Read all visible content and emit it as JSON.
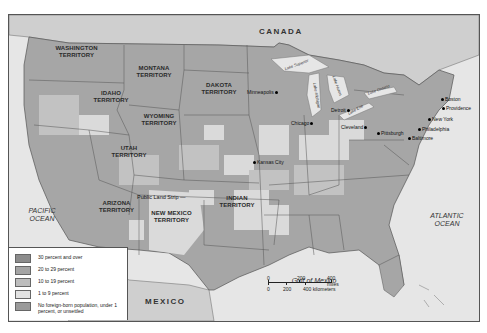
{
  "map": {
    "countries": {
      "canada": "CANADA",
      "mexico": "MEXICO"
    },
    "water_bodies": {
      "pacific": "PACIFIC OCEAN",
      "atlantic": "ATLANTIC OCEAN",
      "gulf": "Gulf of Mexico"
    },
    "lakes": [
      "Lake Superior",
      "Lake Michigan",
      "Lake Huron",
      "Lake Erie",
      "Lake Ontario"
    ],
    "territories": [
      {
        "name": "WASHINGTON TERRITORY"
      },
      {
        "name": "MONTANA TERRITORY"
      },
      {
        "name": "IDAHO TERRITORY"
      },
      {
        "name": "DAKOTA TERRITORY"
      },
      {
        "name": "WYOMING TERRITORY"
      },
      {
        "name": "UTAH TERRITORY"
      },
      {
        "name": "ARIZONA TERRITORY"
      },
      {
        "name": "NEW MEXICO TERRITORY"
      },
      {
        "name": "INDIAN TERRITORY"
      }
    ],
    "regions": {
      "public_land_strip": "Public Land Strip"
    },
    "cities": [
      "Minneapolis",
      "Chicago",
      "Detroit",
      "Cleveland",
      "Pittsburgh",
      "Kansas City",
      "Boston",
      "Providence",
      "New York",
      "Philadelphia",
      "Baltimore"
    ],
    "legend": {
      "items": [
        {
          "label": "30 percent and over",
          "color": "#8c8c8c"
        },
        {
          "label": "20 to 29 percent",
          "color": "#a4a4a4"
        },
        {
          "label": "10 to 19 percent",
          "color": "#bdbdbd"
        },
        {
          "label": "1 to 9 percent",
          "color": "#e2e2e2"
        },
        {
          "label": "No foreign-born population, under 1 percent, or unsettled",
          "color": "#9a9a9a"
        }
      ]
    },
    "scale": {
      "miles": [
        "0",
        "200",
        "400 miles"
      ],
      "km": [
        "0",
        "200",
        "400 kilometers"
      ]
    }
  }
}
